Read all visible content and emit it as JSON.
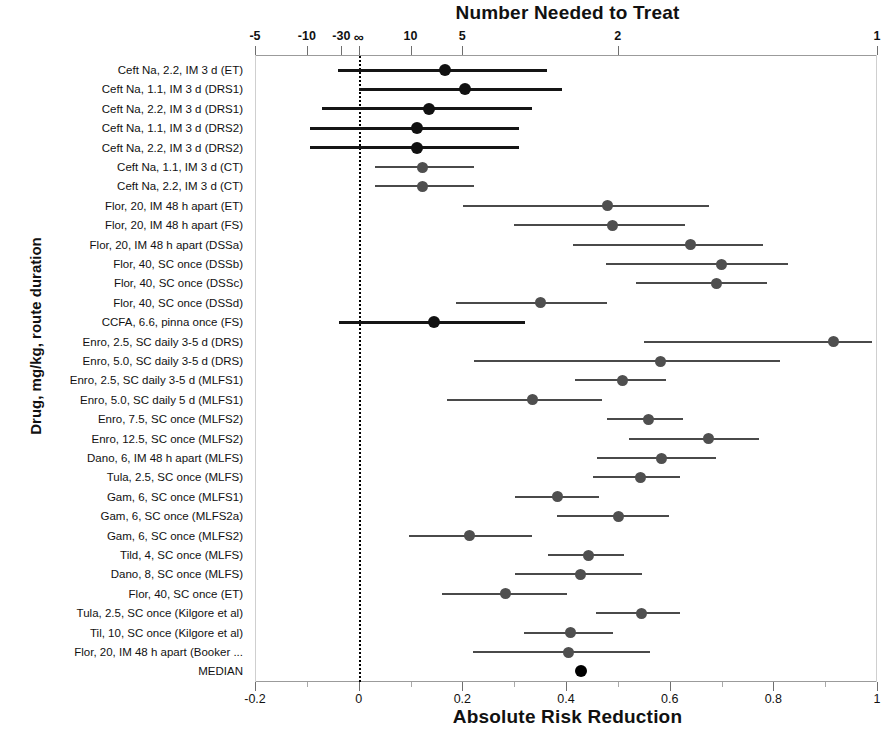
{
  "chart_data": {
    "type": "scatter",
    "title": "Number Needed to Treat",
    "xlabel": "Absolute Risk Reduction",
    "ylabel": "Drug, mg/kg, route duration",
    "subtitle": "",
    "grid": false,
    "legend": "none",
    "xlim": [
      -0.2,
      1.0
    ],
    "axis_bottom": {
      "label": "Absolute Risk Reduction",
      "ticks": [
        -0.2,
        0,
        0.2,
        0.4,
        0.6,
        0.8,
        1
      ],
      "ticklabels": [
        "-0.2",
        "0",
        "0.2",
        "0.4",
        "0.6",
        "0.8",
        "1"
      ],
      "minor_ticks": [
        -0.1,
        0.1,
        0.3,
        0.5,
        0.7,
        0.9
      ]
    },
    "axis_top": {
      "label": "Number Needed to Treat",
      "ticklabels": [
        "-5",
        "-10",
        "-30",
        "∞",
        "10",
        "5",
        "2",
        "1"
      ],
      "tick_arr_values": [
        -0.2,
        -0.1,
        -0.0333,
        0,
        0.1,
        0.2,
        0.5,
        1.0
      ]
    },
    "reference_line": 0,
    "categories": [
      "Ceft Na, 2.2, IM 3 d (ET)",
      "Ceft Na, 1.1, IM 3 d (DRS1)",
      "Ceft Na, 2.2, IM 3 d (DRS1)",
      "Ceft Na, 1.1, IM 3 d (DRS2)",
      "Ceft Na, 2.2, IM 3 d (DRS2)",
      "Ceft Na, 1.1, IM 3 d (CT)",
      "Ceft Na, 2.2, IM 3 d (CT)",
      "Flor, 20, IM 48 h apart (ET)",
      "Flor, 20, IM 48 h apart (FS)",
      "Flor, 20, IM 48 h apart (DSSa)",
      "Flor, 40, SC once (DSSb)",
      "Flor, 40, SC once (DSSc)",
      "Flor, 40, SC once (DSSd)",
      "CCFA, 6.6, pinna once (FS)",
      "Enro, 2.5, SC daily 3-5 d (DRS)",
      "Enro, 5.0, SC daily 3-5 d (DRS)",
      "Enro, 2.5, SC daily 3-5 d (MLFS1)",
      "Enro, 5.0, SC daily 5 d (MLFS1)",
      "Enro, 7.5, SC once (MLFS2)",
      "Enro, 12.5, SC once (MLFS2)",
      "Dano, 6, IM 48 h apart (MLFS)",
      "Tula, 2.5, SC once (MLFS)",
      "Gam, 6, SC once  (MLFS1)",
      "Gam, 6, SC once  (MLFS2a)",
      "Gam, 6, SC once (MLFS2)",
      "Tild, 4, SC once (MLFS)",
      "Dano, 8, SC once (MLFS)",
      "Flor, 40, SC once (ET)",
      "Tula, 2.5, SC once (Kilgore et al)",
      "Til, 10, SC once (Kilgore et al)",
      "Flor, 20, IM 48 h apart (Booker ...",
      "MEDIAN"
    ],
    "points": [
      {
        "label": "Ceft Na, 2.2, IM 3 d (ET)",
        "estimate": 0.166,
        "lower": -0.04,
        "upper": 0.363,
        "heavy": true
      },
      {
        "label": "Ceft Na, 1.1, IM 3 d (DRS1)",
        "estimate": 0.205,
        "lower": 0.0,
        "upper": 0.392,
        "heavy": true
      },
      {
        "label": "Ceft Na, 2.2, IM 3 d (DRS1)",
        "estimate": 0.136,
        "lower": -0.071,
        "upper": 0.334,
        "heavy": true
      },
      {
        "label": "Ceft Na, 1.1, IM 3 d (DRS2)",
        "estimate": 0.113,
        "lower": -0.094,
        "upper": 0.309,
        "heavy": true
      },
      {
        "label": "Ceft Na, 2.2, IM 3 d (DRS2)",
        "estimate": 0.113,
        "lower": -0.094,
        "upper": 0.309,
        "heavy": true
      },
      {
        "label": "Ceft Na, 1.1, IM 3 d (CT)",
        "estimate": 0.123,
        "lower": 0.031,
        "upper": 0.223,
        "heavy": false
      },
      {
        "label": "Ceft Na, 2.2, IM 3 d (CT)",
        "estimate": 0.123,
        "lower": 0.031,
        "upper": 0.223,
        "heavy": false
      },
      {
        "label": "Flor, 20, IM 48 h apart (ET)",
        "estimate": 0.48,
        "lower": 0.202,
        "upper": 0.676,
        "heavy": false
      },
      {
        "label": "Flor, 20, IM 48 h apart (FS)",
        "estimate": 0.489,
        "lower": 0.3,
        "upper": 0.63,
        "heavy": false
      },
      {
        "label": "Flor, 20, IM 48 h apart (DSSa)",
        "estimate": 0.641,
        "lower": 0.413,
        "upper": 0.781,
        "heavy": false
      },
      {
        "label": "Flor, 40, SC once (DSSb)",
        "estimate": 0.7,
        "lower": 0.478,
        "upper": 0.829,
        "heavy": false
      },
      {
        "label": "Flor, 40, SC once (DSSc)",
        "estimate": 0.69,
        "lower": 0.536,
        "upper": 0.787,
        "heavy": false
      },
      {
        "label": "Flor, 40, SC once (DSSd)",
        "estimate": 0.351,
        "lower": 0.188,
        "upper": 0.48,
        "heavy": false
      },
      {
        "label": "CCFA, 6.6, pinna once (FS)",
        "estimate": 0.146,
        "lower": -0.038,
        "upper": 0.321,
        "heavy": true
      },
      {
        "label": "Enro, 2.5, SC daily 3-5 d (DRS)",
        "estimate": 0.916,
        "lower": 0.551,
        "upper": 0.99,
        "heavy": false
      },
      {
        "label": "Enro, 5.0, SC daily 3-5 d (DRS)",
        "estimate": 0.583,
        "lower": 0.223,
        "upper": 0.812,
        "heavy": false
      },
      {
        "label": "Enro, 2.5, SC daily 3-5 d (MLFS1)",
        "estimate": 0.509,
        "lower": 0.418,
        "upper": 0.593,
        "heavy": false
      },
      {
        "label": "Enro, 5.0, SC daily 5 d (MLFS1)",
        "estimate": 0.336,
        "lower": 0.171,
        "upper": 0.47,
        "heavy": false
      },
      {
        "label": "Enro, 7.5, SC once (MLFS2)",
        "estimate": 0.559,
        "lower": 0.48,
        "upper": 0.626,
        "heavy": false
      },
      {
        "label": "Enro, 12.5, SC once (MLFS2)",
        "estimate": 0.674,
        "lower": 0.522,
        "upper": 0.772,
        "heavy": false
      },
      {
        "label": "Dano, 6, IM 48 h apart (MLFS)",
        "estimate": 0.585,
        "lower": 0.459,
        "upper": 0.689,
        "heavy": false
      },
      {
        "label": "Tula, 2.5, SC once (MLFS)",
        "estimate": 0.543,
        "lower": 0.453,
        "upper": 0.62,
        "heavy": false
      },
      {
        "label": "Gam, 6, SC once  (MLFS1)",
        "estimate": 0.384,
        "lower": 0.301,
        "upper": 0.463,
        "heavy": false
      },
      {
        "label": "Gam, 6, SC once  (MLFS2a)",
        "estimate": 0.501,
        "lower": 0.382,
        "upper": 0.599,
        "heavy": false
      },
      {
        "label": "Gam, 6, SC once (MLFS2)",
        "estimate": 0.213,
        "lower": 0.098,
        "upper": 0.334,
        "heavy": false
      },
      {
        "label": "Tild, 4, SC once (MLFS)",
        "estimate": 0.443,
        "lower": 0.366,
        "upper": 0.512,
        "heavy": false
      },
      {
        "label": "Dano, 8, SC once (MLFS)",
        "estimate": 0.428,
        "lower": 0.301,
        "upper": 0.547,
        "heavy": false
      },
      {
        "label": "Flor, 40, SC once (ET)",
        "estimate": 0.284,
        "lower": 0.161,
        "upper": 0.401,
        "heavy": false
      },
      {
        "label": "Tula, 2.5, SC once (Kilgore et al)",
        "estimate": 0.545,
        "lower": 0.457,
        "upper": 0.62,
        "heavy": false
      },
      {
        "label": "Til, 10, SC once (Kilgore et al)",
        "estimate": 0.409,
        "lower": 0.319,
        "upper": 0.49,
        "heavy": false
      },
      {
        "label": "Flor, 20, IM 48 h apart (Booker ...",
        "estimate": 0.405,
        "lower": 0.221,
        "upper": 0.562,
        "heavy": false
      },
      {
        "label": "MEDIAN",
        "estimate": 0.428,
        "lower": null,
        "upper": null,
        "heavy": false,
        "median": true
      }
    ]
  },
  "colors": {
    "marker": "#4f4f4f",
    "marker_heavy": "#151515",
    "axis": "#9b9b9b",
    "reference": "#000000",
    "background": "#ffffff"
  }
}
